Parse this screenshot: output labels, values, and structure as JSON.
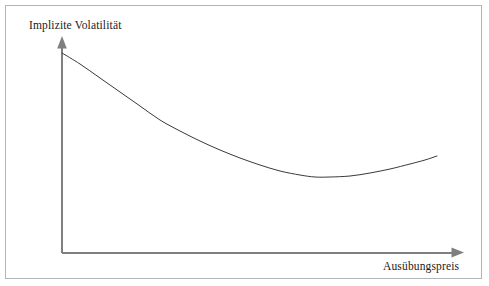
{
  "figure": {
    "background_color": "#ffffff",
    "border_color": "#b5b5b5",
    "axis_color": "#7f7f7f",
    "curve_color": "#3a3a3a",
    "text_color": "#1a1a1a"
  },
  "axes": {
    "y_label": "Implizite Volatilität",
    "x_label": "Ausübungspreis",
    "y_axis_name": "implied-volatility-axis",
    "x_axis_name": "strike-price-axis",
    "origin": {
      "x": 62,
      "y": 253
    },
    "y_arrow_tip": {
      "x": 62,
      "y": 37
    },
    "x_arrow_tip": {
      "x": 463,
      "y": 252
    }
  },
  "chart_data": {
    "type": "line",
    "title": "",
    "xlabel": "Ausübungspreis",
    "ylabel": "Implizite Volatilität",
    "grid": false,
    "legend": null,
    "xlim": [
      62,
      463
    ],
    "ylim": [
      253,
      37
    ],
    "axis_ticks": {
      "x": [],
      "y": []
    },
    "series": [
      {
        "name": "Volatilitätsskew",
        "points": [
          {
            "x": 62,
            "y": 53
          },
          {
            "x": 80,
            "y": 64
          },
          {
            "x": 100,
            "y": 78
          },
          {
            "x": 120,
            "y": 92
          },
          {
            "x": 140,
            "y": 106
          },
          {
            "x": 160,
            "y": 120
          },
          {
            "x": 180,
            "y": 131
          },
          {
            "x": 200,
            "y": 141
          },
          {
            "x": 220,
            "y": 150
          },
          {
            "x": 240,
            "y": 158
          },
          {
            "x": 260,
            "y": 165
          },
          {
            "x": 280,
            "y": 171
          },
          {
            "x": 300,
            "y": 175
          },
          {
            "x": 315,
            "y": 177
          },
          {
            "x": 330,
            "y": 177
          },
          {
            "x": 350,
            "y": 176
          },
          {
            "x": 370,
            "y": 173
          },
          {
            "x": 390,
            "y": 169
          },
          {
            "x": 410,
            "y": 164
          },
          {
            "x": 425,
            "y": 160
          },
          {
            "x": 437,
            "y": 156
          }
        ]
      }
    ]
  }
}
